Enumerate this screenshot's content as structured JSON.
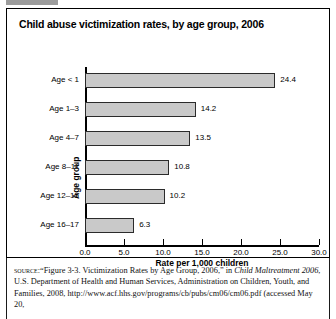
{
  "figure": {
    "title": "Child abuse victimization rates, by age group, 2006"
  },
  "chart_data": {
    "type": "bar",
    "orientation": "horizontal",
    "title": "Child abuse victimization rates, by age group, 2006",
    "xlabel": "Rate per 1,000 children",
    "ylabel": "Age group",
    "categories": [
      "Age < 1",
      "Age 1–3",
      "Age 4–7",
      "Age 8–11",
      "Age 12–15",
      "Age 16–17"
    ],
    "values": [
      24.4,
      14.2,
      13.5,
      10.8,
      10.2,
      6.3
    ],
    "value_labels": [
      "24.4",
      "14.2",
      "13.5",
      "10.8",
      "10.2",
      "6.3"
    ],
    "xlim": [
      0.0,
      30.0
    ],
    "xticks": [
      0.0,
      5.0,
      10.0,
      15.0,
      20.0,
      25.0,
      30.0
    ],
    "xtick_labels": [
      "0.0",
      "5.0",
      "10.0",
      "15.0",
      "20.0",
      "25.0",
      "30.0"
    ],
    "grid": false,
    "legend": null,
    "bar_fill_color": "#c9c9c9",
    "bar_edge_color": "#2b2b2b"
  },
  "source": {
    "kicker": "source:",
    "line_1_quote": "“Figure 3-3. Victimization Rates by Age Group, 2006,” in",
    "italic_title": "Child Maltreatment 2006",
    "rest": ", U.S. Department of Health and Human Services, Administration on Children, Youth, and Families, 2008, http://www.acf.hhs.gov/programs/cb/pubs/cm06/cm06.pdf (accessed May 20,"
  }
}
